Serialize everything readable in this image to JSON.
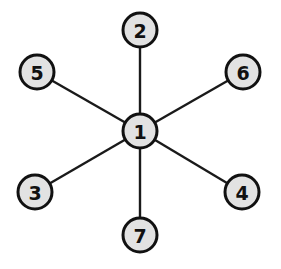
{
  "diagram": {
    "type": "star-graph",
    "colors": {
      "node_fill": "#e2e2e2",
      "node_stroke": "#111111",
      "edge": "#1a1a1a",
      "background": "#ffffff"
    },
    "nodes": [
      {
        "id": "1",
        "label": "1",
        "x": 140,
        "y": 131
      },
      {
        "id": "2",
        "label": "2",
        "x": 140,
        "y": 30
      },
      {
        "id": "3",
        "label": "3",
        "x": 35,
        "y": 192
      },
      {
        "id": "4",
        "label": "4",
        "x": 242,
        "y": 192
      },
      {
        "id": "5",
        "label": "5",
        "x": 37,
        "y": 72
      },
      {
        "id": "6",
        "label": "6",
        "x": 243,
        "y": 72
      },
      {
        "id": "7",
        "label": "7",
        "x": 140,
        "y": 235
      }
    ],
    "edges": [
      {
        "from": "1",
        "to": "2"
      },
      {
        "from": "1",
        "to": "3"
      },
      {
        "from": "1",
        "to": "4"
      },
      {
        "from": "1",
        "to": "5"
      },
      {
        "from": "1",
        "to": "6"
      },
      {
        "from": "1",
        "to": "7"
      }
    ]
  }
}
